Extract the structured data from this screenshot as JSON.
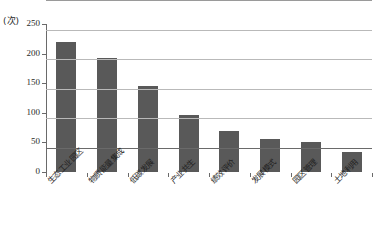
{
  "chart_data": {
    "type": "bar",
    "title": "",
    "subtitle": "",
    "unit_label": "(次)",
    "xlabel": "",
    "ylabel": "",
    "ylim": [
      0,
      250
    ],
    "ytick_step": 50,
    "yticks": [
      "0",
      "50",
      "100",
      "150",
      "200",
      "250"
    ],
    "grid": true,
    "legend": "none",
    "bar_color": "#595959",
    "categories": [
      "生态工业园区",
      "物质能量集成",
      "低碳发展",
      "产业共生",
      "绩效评价",
      "发展模式",
      "园区管理",
      "土地利用"
    ],
    "values": [
      220,
      193,
      146,
      97,
      70,
      56,
      51,
      33
    ]
  }
}
